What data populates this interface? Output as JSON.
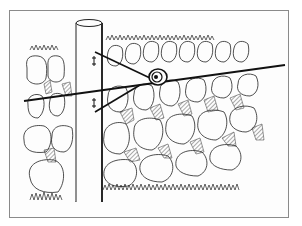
{
  "illustration": {
    "subject": "Fence post with insulator and wire in front of a dry stone wall",
    "elements": [
      "fence-post",
      "insulator",
      "fence-wire",
      "brace-wires",
      "stone-wall",
      "grass"
    ],
    "colors": {
      "ink": "#1a1a1a",
      "paper": "#fdfdfd",
      "frame": "#8a8a8a",
      "hatch": "#555555"
    }
  }
}
